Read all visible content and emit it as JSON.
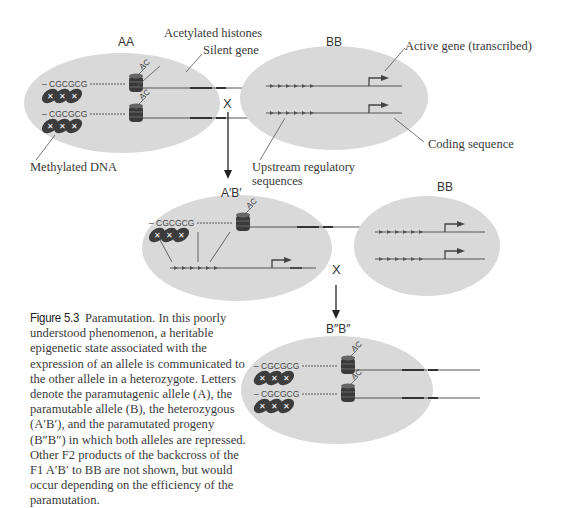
{
  "figure": {
    "cells": {
      "aa": {
        "label": "AA"
      },
      "bb_top": {
        "label": "BB"
      },
      "ab": {
        "label": "A′B′"
      },
      "bb_mid": {
        "label": "BB"
      },
      "b2b2": {
        "label": "B″B″"
      }
    },
    "cross_symbols": [
      "X",
      "X",
      "X"
    ],
    "callouts": {
      "acetylated_histones": "Acetylated histones",
      "silent_gene": "Silent gene",
      "methylated_dna": "Methylated DNA",
      "active_gene": "Active gene (transcribed)",
      "coding_sequence": "Coding sequence",
      "upstream_line1": "Upstream regulatory",
      "upstream_line2": "sequences"
    },
    "glyph_text": {
      "cpg": "– CGCGCG",
      "acetyl": "AC"
    },
    "colors": {
      "cell_fill": "#d9d9d9",
      "dark_glyph": "#3c3c3c",
      "line": "#555555"
    }
  },
  "caption": {
    "figure_number": "Figure 5.3",
    "text": " Paramutation. In this poorly understood phenomenon, a heritable epigenetic state associated with the expression of an allele is communicated to the other allele in a heterozygote. Letters denote the paramutagenic allele (A), the paramutable allele (B), the heterozygous (A′B′), and the paramutated progeny (B″B″) in which both alleles are repressed. Other F2 products of the backcross of the F1 A′B′ to BB are not shown, but would occur depending on the efficiency of the paramutation."
  }
}
